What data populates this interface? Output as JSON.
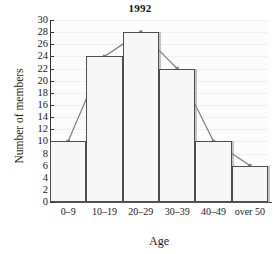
{
  "chart_data": {
    "type": "bar",
    "title": "1992",
    "xlabel": "Age",
    "ylabel": "Number of members",
    "categories": [
      "0–9",
      "10–19",
      "20–29",
      "30–39",
      "40–49",
      "over 50"
    ],
    "values": [
      10,
      24,
      28,
      22,
      10,
      6
    ],
    "series": [
      {
        "name": "Histogram bars",
        "values": [
          10,
          24,
          28,
          22,
          10,
          6
        ]
      },
      {
        "name": "Frequency polygon",
        "values": [
          10,
          24,
          28,
          22,
          10,
          6
        ]
      }
    ],
    "ylim": [
      0,
      30
    ],
    "ytick_step": 2,
    "yticks": [
      0,
      2,
      4,
      6,
      8,
      10,
      12,
      14,
      16,
      18,
      20,
      22,
      24,
      26,
      28,
      30
    ],
    "ytick_labels": [
      "0",
      "2",
      "4",
      "6",
      "8",
      "10",
      "12",
      "14",
      "16",
      "18",
      "20",
      "22",
      "24",
      "26",
      "28",
      "30"
    ],
    "grid": true,
    "legend": false,
    "overlay": "frequency-polygon",
    "colors": {
      "bar_fill": "#f7f7f7",
      "bar_edge": "#4d4d4d",
      "polygon_line": "#808080",
      "axis": "#333333",
      "grid": "#f0f0f0",
      "text": "#1a1a1a",
      "background": "#ffffff"
    }
  }
}
